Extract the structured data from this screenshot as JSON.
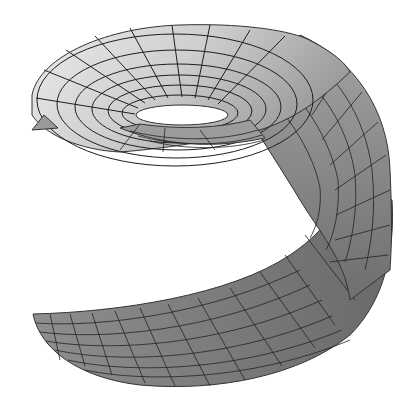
{
  "figure": {
    "background": "#ffffff",
    "colors": {
      "top_light": "#e4e4e4",
      "top_mid": "#bdbdbd",
      "band_dark": "#8a8a8a",
      "bottom": "#7a7a7a",
      "grid": "#1e1e1e",
      "hole": "#ffffff"
    }
  }
}
